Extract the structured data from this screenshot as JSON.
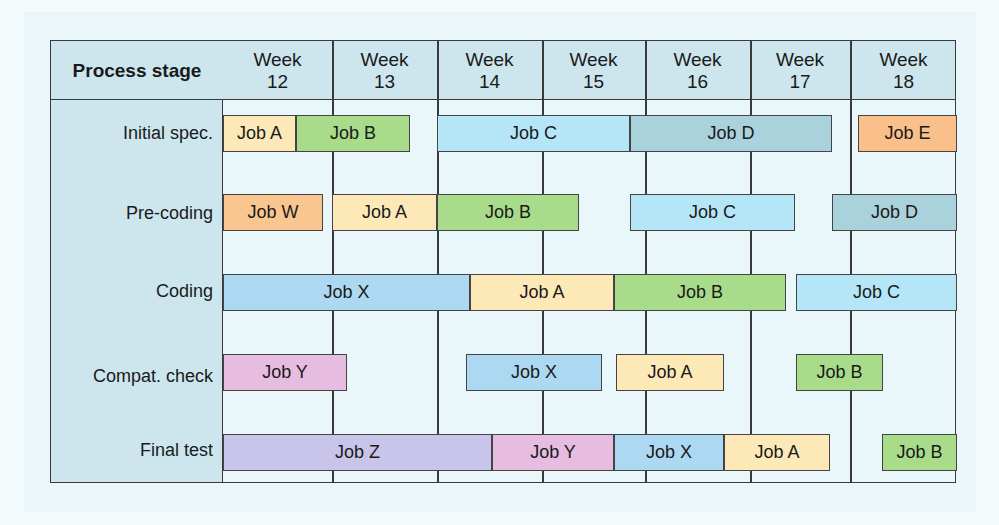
{
  "chart_data": {
    "type": "gantt",
    "title": "",
    "row_header": "Process stage",
    "columns": [
      "Week 12",
      "Week 13",
      "Week 14",
      "Week 15",
      "Week 16",
      "Week 17",
      "Week 18"
    ],
    "week_numbers": [
      12,
      13,
      14,
      15,
      16,
      17,
      18
    ],
    "stages": [
      "Initial spec.",
      "Pre-coding",
      "Coding",
      "Compat. check",
      "Final test"
    ],
    "colors": {
      "Job A": "#fde9b8",
      "Job B": "#a8dc8a",
      "Job C": "#b5e6f7",
      "Job D": "#a9d2dc",
      "Job E": "#f9c08a",
      "Job W": "#f9c68f",
      "Job X": "#add8f2",
      "Job Y": "#e6bde0",
      "Job Z": "#c9c4ea"
    },
    "tasks": [
      {
        "stage": "Initial spec.",
        "job": "Job A",
        "start_week": 12.0,
        "end_week": 12.67
      },
      {
        "stage": "Initial spec.",
        "job": "Job B",
        "start_week": 12.67,
        "end_week": 13.75
      },
      {
        "stage": "Initial spec.",
        "job": "Job C",
        "start_week": 14.0,
        "end_week": 15.85
      },
      {
        "stage": "Initial spec.",
        "job": "Job D",
        "start_week": 15.85,
        "end_week": 17.8
      },
      {
        "stage": "Initial spec.",
        "job": "Job E",
        "start_week": 18.08,
        "end_week": 19.0
      },
      {
        "stage": "Pre-coding",
        "job": "Job W",
        "start_week": 12.0,
        "end_week": 12.92
      },
      {
        "stage": "Pre-coding",
        "job": "Job A",
        "start_week": 13.0,
        "end_week": 14.0
      },
      {
        "stage": "Pre-coding",
        "job": "Job B",
        "start_week": 14.0,
        "end_week": 15.35
      },
      {
        "stage": "Pre-coding",
        "job": "Job C",
        "start_week": 15.85,
        "end_week": 17.45
      },
      {
        "stage": "Pre-coding",
        "job": "Job D",
        "start_week": 17.8,
        "end_week": 19.0
      },
      {
        "stage": "Coding",
        "job": "Job X",
        "start_week": 12.0,
        "end_week": 14.3
      },
      {
        "stage": "Coding",
        "job": "Job A",
        "start_week": 14.3,
        "end_week": 15.7
      },
      {
        "stage": "Coding",
        "job": "Job B",
        "start_week": 15.7,
        "end_week": 17.35
      },
      {
        "stage": "Coding",
        "job": "Job C",
        "start_week": 17.45,
        "end_week": 19.0
      },
      {
        "stage": "Compat. check",
        "job": "Job Y",
        "start_week": 12.0,
        "end_week": 13.15
      },
      {
        "stage": "Compat. check",
        "job": "Job X",
        "start_week": 14.27,
        "end_week": 15.58
      },
      {
        "stage": "Compat. check",
        "job": "Job A",
        "start_week": 15.72,
        "end_week": 16.76
      },
      {
        "stage": "Compat. check",
        "job": "Job B",
        "start_week": 17.45,
        "end_week": 18.3
      },
      {
        "stage": "Final test",
        "job": "Job Z",
        "start_week": 12.0,
        "end_week": 14.52
      },
      {
        "stage": "Final test",
        "job": "Job Y",
        "start_week": 14.52,
        "end_week": 15.7
      },
      {
        "stage": "Final test",
        "job": "Job X",
        "start_week": 15.7,
        "end_week": 16.76
      },
      {
        "stage": "Final test",
        "job": "Job A",
        "start_week": 16.76,
        "end_week": 17.8
      },
      {
        "stage": "Final test",
        "job": "Job B",
        "start_week": 18.3,
        "end_week": 19.0
      }
    ],
    "xlabel": "",
    "ylabel": "",
    "grid": true
  },
  "header": {
    "title": "Process stage",
    "weeks": [
      {
        "line1": "Week",
        "line2": "12"
      },
      {
        "line1": "Week",
        "line2": "13"
      },
      {
        "line1": "Week",
        "line2": "14"
      },
      {
        "line1": "Week",
        "line2": "15"
      },
      {
        "line1": "Week",
        "line2": "16"
      },
      {
        "line1": "Week",
        "line2": "17"
      },
      {
        "line1": "Week",
        "line2": "18"
      }
    ]
  },
  "stages": [
    "Initial spec.",
    "Pre-coding",
    "Coding",
    "Compat. check",
    "Final test"
  ],
  "rows": [
    {
      "bars": [
        {
          "label": "Job A",
          "x": 222,
          "w": 73,
          "color": "#fde9b8"
        },
        {
          "label": "Job B",
          "x": 295,
          "w": 114,
          "color": "#a8dc8a"
        },
        {
          "label": "Job C",
          "x": 436,
          "w": 193,
          "color": "#b5e6f7"
        },
        {
          "label": "Job D",
          "x": 629,
          "w": 202,
          "color": "#a9d2dc"
        },
        {
          "label": "Job E",
          "x": 857,
          "w": 99,
          "color": "#f9c08a"
        }
      ]
    },
    {
      "bars": [
        {
          "label": "Job W",
          "x": 222,
          "w": 100,
          "color": "#f9c68f"
        },
        {
          "label": "Job A",
          "x": 331,
          "w": 105,
          "color": "#fde9b8"
        },
        {
          "label": "Job B",
          "x": 436,
          "w": 142,
          "color": "#a8dc8a"
        },
        {
          "label": "Job C",
          "x": 629,
          "w": 165,
          "color": "#b5e6f7"
        },
        {
          "label": "Job D",
          "x": 831,
          "w": 125,
          "color": "#a9d2dc"
        }
      ]
    },
    {
      "bars": [
        {
          "label": "Job X",
          "x": 222,
          "w": 247,
          "color": "#add8f2"
        },
        {
          "label": "Job A",
          "x": 469,
          "w": 144,
          "color": "#fde9b8"
        },
        {
          "label": "Job B",
          "x": 613,
          "w": 172,
          "color": "#a8dc8a"
        },
        {
          "label": "Job C",
          "x": 795,
          "w": 161,
          "color": "#b5e6f7"
        }
      ]
    },
    {
      "bars": [
        {
          "label": "Job Y",
          "x": 222,
          "w": 124,
          "color": "#e6bde0"
        },
        {
          "label": "Job X",
          "x": 465,
          "w": 136,
          "color": "#add8f2"
        },
        {
          "label": "Job A",
          "x": 615,
          "w": 108,
          "color": "#fde9b8"
        },
        {
          "label": "Job B",
          "x": 795,
          "w": 87,
          "color": "#a8dc8a"
        }
      ]
    },
    {
      "bars": [
        {
          "label": "Job Z",
          "x": 222,
          "w": 269,
          "color": "#c9c4ea"
        },
        {
          "label": "Job Y",
          "x": 491,
          "w": 122,
          "color": "#e6bde0"
        },
        {
          "label": "Job X",
          "x": 613,
          "w": 110,
          "color": "#add8f2"
        },
        {
          "label": "Job A",
          "x": 723,
          "w": 106,
          "color": "#fde9b8"
        },
        {
          "label": "Job B",
          "x": 881,
          "w": 75,
          "color": "#a8dc8a"
        }
      ]
    }
  ]
}
